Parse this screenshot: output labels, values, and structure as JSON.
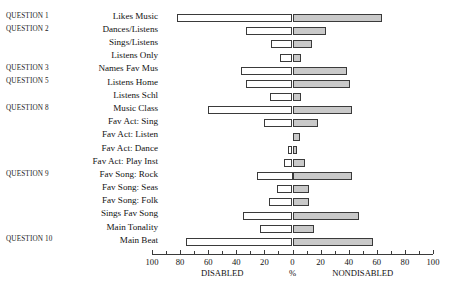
{
  "chart_data": {
    "type": "bar",
    "title": "",
    "xlabel": "%",
    "ylabel": "",
    "orientation": "horizontal-diverging",
    "left_group_label": "DISABLED",
    "right_group_label": "NONDISABLED",
    "center_label": "%",
    "xlim": [
      -100,
      100
    ],
    "grid": false,
    "legend": "none",
    "axis_ticks": [
      {
        "label": "100",
        "value": -100
      },
      {
        "label": "80",
        "value": -80
      },
      {
        "label": "60",
        "value": -60
      },
      {
        "label": "40",
        "value": -40
      },
      {
        "label": "20",
        "value": -20
      },
      {
        "label": "0",
        "value": 0
      },
      {
        "label": "20",
        "value": 20
      },
      {
        "label": "40",
        "value": 40
      },
      {
        "label": "60",
        "value": 60
      },
      {
        "label": "80",
        "value": 80
      },
      {
        "label": "100",
        "value": 100
      }
    ],
    "minor_ticks": [
      -90,
      -70,
      -50,
      -30,
      -10,
      10,
      30,
      50,
      70,
      90
    ],
    "categories": [
      "Likes Music",
      "Dances/Listens",
      "Sings/Listens",
      "Listens Only",
      "Names Fav Mus",
      "Listens Home",
      "Listens Schl",
      "Music Class",
      "Fav Act: Sing",
      "Fav Act: Listen",
      "Fav Act: Dance",
      "Fav Act: Play Inst",
      "Fav Song: Rock",
      "Fav Song: Seas",
      "Fav Song: Folk",
      "Sings Fav Song",
      "Main Tonality",
      "Main Beat"
    ],
    "question_labels": [
      "QUESTION 1",
      "QUESTION 2",
      "",
      "",
      "QUESTION 3",
      "QUESTION 5",
      "",
      "QUESTION 8",
      "",
      "",
      "",
      "",
      "QUESTION 9",
      "",
      "",
      "",
      "",
      "QUESTION 10"
    ],
    "series": [
      {
        "name": "DISABLED",
        "values": [
          82,
          33,
          15,
          9,
          37,
          33,
          16,
          60,
          20,
          0,
          3,
          6,
          25,
          11,
          17,
          35,
          23,
          76
        ]
      },
      {
        "name": "NONDISABLED",
        "values": [
          64,
          24,
          14,
          6,
          39,
          41,
          6,
          42,
          18,
          5,
          3,
          9,
          42,
          12,
          12,
          47,
          15,
          57
        ]
      }
    ],
    "rows": [
      {
        "label": "Likes Music",
        "question": "QUESTION 1",
        "disabled": 82,
        "nondisabled": 64
      },
      {
        "label": "Dances/Listens",
        "question": "QUESTION 2",
        "disabled": 33,
        "nondisabled": 24
      },
      {
        "label": "Sings/Listens",
        "question": "",
        "disabled": 15,
        "nondisabled": 14
      },
      {
        "label": "Listens Only",
        "question": "",
        "disabled": 9,
        "nondisabled": 6
      },
      {
        "label": "Names Fav Mus",
        "question": "QUESTION 3",
        "disabled": 37,
        "nondisabled": 39
      },
      {
        "label": "Listens Home",
        "question": "QUESTION 5",
        "disabled": 33,
        "nondisabled": 41
      },
      {
        "label": "Listens Schl",
        "question": "",
        "disabled": 16,
        "nondisabled": 6
      },
      {
        "label": "Music Class",
        "question": "QUESTION 8",
        "disabled": 60,
        "nondisabled": 42
      },
      {
        "label": "Fav Act: Sing",
        "question": "",
        "disabled": 20,
        "nondisabled": 18
      },
      {
        "label": "Fav Act: Listen",
        "question": "",
        "disabled": 0,
        "nondisabled": 5
      },
      {
        "label": "Fav Act: Dance",
        "question": "",
        "disabled": 3,
        "nondisabled": 3
      },
      {
        "label": "Fav Act: Play Inst",
        "question": "",
        "disabled": 6,
        "nondisabled": 9
      },
      {
        "label": "Fav Song: Rock",
        "question": "QUESTION 9",
        "disabled": 25,
        "nondisabled": 42
      },
      {
        "label": "Fav Song: Seas",
        "question": "",
        "disabled": 11,
        "nondisabled": 12
      },
      {
        "label": "Fav Song: Folk",
        "question": "",
        "disabled": 17,
        "nondisabled": 12
      },
      {
        "label": "Sings Fav Song",
        "question": "",
        "disabled": 35,
        "nondisabled": 47
      },
      {
        "label": "Main Tonality",
        "question": "",
        "disabled": 23,
        "nondisabled": 15
      },
      {
        "label": "Main Beat",
        "question": "QUESTION 10",
        "disabled": 76,
        "nondisabled": 57
      }
    ]
  }
}
